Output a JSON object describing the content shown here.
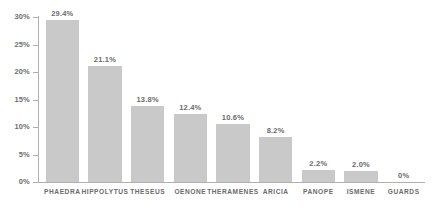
{
  "chart_data": {
    "type": "bar",
    "title": "",
    "subtitle": "",
    "xlabel": "",
    "ylabel": "",
    "categories": [
      "PHAEDRA",
      "HIPPOLYTUS",
      "THESEUS",
      "OENONE",
      "THERAMENES",
      "ARICIA",
      "PANOPE",
      "ISMENE",
      "GUARDS"
    ],
    "values": [
      29.4,
      21.1,
      13.8,
      12.4,
      10.6,
      8.2,
      2.2,
      2.0,
      0
    ],
    "value_labels": [
      "29.4%",
      "21.1%",
      "13.8%",
      "12.4%",
      "10.6%",
      "8.2%",
      "2.2%",
      "2.0%",
      "0%"
    ],
    "ylim": [
      0,
      30
    ],
    "yticks": [
      0,
      5,
      10,
      15,
      20,
      25,
      30
    ],
    "ytick_labels": [
      "0%",
      "5%",
      "10%",
      "15%",
      "20%",
      "25%",
      "30%"
    ],
    "grid": false,
    "legend": null,
    "bar_color": "#c9c9c9",
    "axis_color": "#b0b0b0",
    "text_color": "#6b6b6b"
  }
}
